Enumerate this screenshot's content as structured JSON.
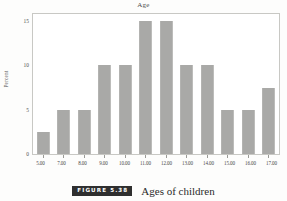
{
  "figure": {
    "badge_label": "FIGURE 5.38",
    "caption": "Ages of children",
    "badge_color": "#2f2f2f",
    "bar_color": "#a9a9a7",
    "frame_color": "#c8c8c4"
  },
  "chart_data": {
    "type": "bar",
    "title": "Age",
    "xlabel": "",
    "ylabel": "Percent",
    "categories": [
      "5.00",
      "7.00",
      "8.00",
      "9.00",
      "10.00",
      "11.00",
      "12.00",
      "13.00",
      "14.00",
      "15.00",
      "16.00",
      "17.00"
    ],
    "values": [
      2.5,
      5,
      5,
      10,
      10,
      15,
      15,
      10,
      10,
      5,
      5,
      7.5
    ],
    "ylim": [
      0,
      15.8
    ],
    "yticks": [
      0,
      5,
      10,
      15
    ],
    "ytick_labels": [
      "0",
      "5",
      "10",
      "15"
    ],
    "grid": false,
    "legend": null
  }
}
